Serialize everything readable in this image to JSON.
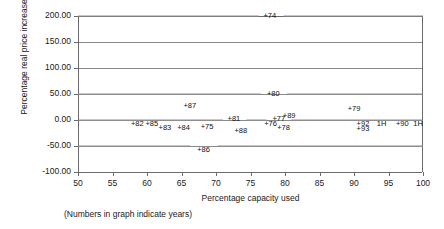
{
  "chart_data": {
    "type": "scatter",
    "title": "",
    "xlabel": "Percentage capacity used",
    "ylabel": "Percentage real price increase",
    "note": "(Numbers in graph indicate years)",
    "xlim": [
      50,
      100
    ],
    "ylim": [
      -100,
      200
    ],
    "xticks": [
      "50",
      "55",
      "60",
      "65",
      "70",
      "75",
      "80",
      "85",
      "90",
      "95",
      "100"
    ],
    "xtick_values": [
      50,
      55,
      60,
      65,
      70,
      75,
      80,
      85,
      90,
      95,
      100
    ],
    "yticks": [
      "200.00",
      "150.00",
      "100.00",
      "50.00",
      "0.00",
      "-50.00",
      "-100.00"
    ],
    "ytick_values": [
      200,
      150,
      100,
      50,
      0,
      -50,
      -100
    ],
    "grid": "horizontal",
    "legend": "none",
    "line_color": "#8f8f8f",
    "axis_color": "#6b6b6b",
    "text_color": "#101010",
    "points": [
      {
        "label": "+74",
        "x": 77.8,
        "y": 200.0,
        "dx": 0,
        "dy": -1
      },
      {
        "label": "+80",
        "x": 78.3,
        "y": 50.0,
        "dx": 0,
        "dy": -1
      },
      {
        "label": "+79",
        "x": 90.0,
        "y": 22.0,
        "dx": 0,
        "dy": -1
      },
      {
        "label": "+87",
        "x": 66.2,
        "y": 26.0,
        "dx": 0,
        "dy": -1
      },
      {
        "label": "+81",
        "x": 72.6,
        "y": 2.0,
        "dx": 0,
        "dy": -1
      },
      {
        "label": "+89",
        "x": 80.6,
        "y": 7.0,
        "dx": 0,
        "dy": -1
      },
      {
        "label": "+77",
        "x": 79.1,
        "y": 2.0,
        "dx": 0,
        "dy": -1
      },
      {
        "label": "+82",
        "x": 58.6,
        "y": -8.0,
        "dx": 0,
        "dy": 1
      },
      {
        "label": "+85",
        "x": 60.7,
        "y": -8.0,
        "dx": 0,
        "dy": 1
      },
      {
        "label": "+83",
        "x": 62.6,
        "y": -16.0,
        "dx": 0,
        "dy": 1
      },
      {
        "label": "+84",
        "x": 65.3,
        "y": -16.0,
        "dx": 0,
        "dy": 1
      },
      {
        "label": "+75",
        "x": 68.7,
        "y": -14.0,
        "dx": 0,
        "dy": 1
      },
      {
        "label": "+88",
        "x": 73.6,
        "y": -22.0,
        "dx": 0,
        "dy": 1
      },
      {
        "label": "+76",
        "x": 77.9,
        "y": -7.0,
        "dx": 0,
        "dy": 1
      },
      {
        "label": "+78",
        "x": 79.8,
        "y": -16.0,
        "dx": 0,
        "dy": 1
      },
      {
        "label": "+92",
        "x": 91.3,
        "y": -7.0,
        "dx": 0,
        "dy": 1
      },
      {
        "label": "+93",
        "x": 91.3,
        "y": -17.0,
        "dx": 0,
        "dy": 1
      },
      {
        "label": "1H",
        "x": 94.0,
        "y": -7.0,
        "dx": 0,
        "dy": 1
      },
      {
        "label": "+90",
        "x": 97.0,
        "y": -7.0,
        "dx": 0,
        "dy": 1
      },
      {
        "label": "1H",
        "x": 99.3,
        "y": -7.0,
        "dx": 0,
        "dy": 1
      },
      {
        "label": "+86",
        "x": 68.2,
        "y": -57.0,
        "dx": 0,
        "dy": 1
      }
    ],
    "line_segments": [
      [
        [
          50.0,
          200.0
        ],
        [
          76.2,
          200.0
        ]
      ],
      [
        [
          79.8,
          200.0
        ],
        [
          100.0,
          200.0
        ]
      ],
      [
        [
          50.0,
          50.0
        ],
        [
          76.5,
          50.0
        ]
      ],
      [
        [
          80.3,
          50.0
        ],
        [
          100.0,
          50.0
        ]
      ],
      [
        [
          50.0,
          0.0
        ],
        [
          71.0,
          0.0
        ]
      ],
      [
        [
          74.4,
          0.0
        ],
        [
          77.3,
          0.0
        ]
      ],
      [
        [
          80.9,
          0.0
        ],
        [
          100.0,
          0.0
        ]
      ],
      [
        [
          50.0,
          -50.0
        ],
        [
          66.3,
          -50.0
        ]
      ],
      [
        [
          70.2,
          -50.0
        ],
        [
          100.0,
          -50.0
        ]
      ]
    ]
  }
}
